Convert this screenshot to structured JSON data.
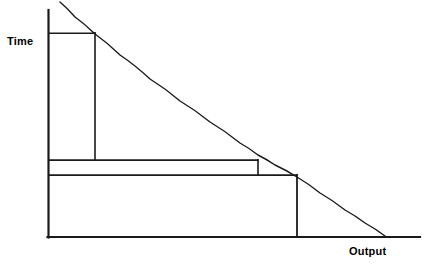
{
  "chart_data": {
    "type": "line",
    "title": "",
    "subtitle": "",
    "xlabel": "Output",
    "ylabel": "Time",
    "grid": false,
    "legend": null,
    "annotations": [],
    "axes": {
      "origin": [
        48,
        237
      ],
      "x_axis_end": [
        420,
        237
      ],
      "y_axis_top": [
        48,
        10
      ],
      "xlim": [
        0,
        1
      ],
      "ylim": [
        0,
        1
      ],
      "x_tick_labels": [],
      "y_tick_labels": []
    },
    "series": [
      {
        "name": "curve",
        "type": "line",
        "description": "downward-sloping convex curve",
        "stroke": "#1a1a1a",
        "stroke_width": 1.4,
        "points": [
          [
            60,
            2
          ],
          [
            75,
            17
          ],
          [
            95,
            34
          ],
          [
            120,
            55
          ],
          [
            150,
            79
          ],
          [
            180,
            101
          ],
          [
            210,
            122
          ],
          [
            240,
            143
          ],
          [
            258,
            155
          ],
          [
            275,
            165
          ],
          [
            297,
            177
          ],
          [
            320,
            193
          ],
          [
            345,
            210
          ],
          [
            365,
            223
          ],
          [
            385,
            236
          ]
        ]
      }
    ],
    "rectangles": [
      {
        "name": "tall-narrow-rectangle",
        "x0": 48,
        "y0": 33,
        "x1": 95,
        "y1": 160,
        "stroke": "#1a1a1a",
        "fill": "none"
      },
      {
        "name": "middle-wide-rectangle",
        "x0": 48,
        "y0": 160,
        "x1": 258,
        "y1": 175,
        "stroke": "#1a1a1a",
        "fill": "none"
      },
      {
        "name": "bottom-widest-rectangle",
        "x0": 48,
        "y0": 175,
        "x1": 297,
        "y1": 237,
        "stroke": "#1a1a1a",
        "fill": "none"
      }
    ],
    "colors": {
      "background": "#ffffff",
      "line": "#1a1a1a",
      "axis": "#1a1a1a",
      "text": "#000000"
    }
  },
  "labels": {
    "y_axis": "Time",
    "x_axis": "Output"
  }
}
